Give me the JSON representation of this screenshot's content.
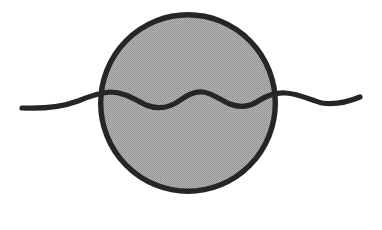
{
  "figure": {
    "title": "Wavy line through shaded circle",
    "background_color": "#ffffff",
    "canvas": {
      "width": 382,
      "height": 230
    }
  },
  "style": {
    "ink_color": "#262626",
    "fill_color": "#a9a9a9",
    "fill_texture": "halftone-dither",
    "halftone_dot_color": "#8c8c8c",
    "stroke_width_circle": 5.4,
    "stroke_width_wave": 5.2,
    "stroke_linecap": "round"
  },
  "shapes": {
    "circle": {
      "name": "shaded-circle",
      "center_x": 188,
      "center_y": 103,
      "radius_x": 90,
      "radius_y": 91,
      "bounds": {
        "left": 98,
        "top": 12,
        "right": 278,
        "bottom": 194
      },
      "fill": "#a9a9a9",
      "stroke": "#262626"
    },
    "wave": {
      "name": "wavy-line",
      "start_x": 22,
      "start_y": 108,
      "end_x": 360,
      "end_y": 97,
      "stroke": "#262626",
      "path": "M 22 108 C 46 109 62 107 78 101 C 90 96 98 93 110 92 C 124 92 134 99 146 105 C 158 110 170 108 182 99 C 190 93 196 91 203 92 C 212 93 220 100 230 104 C 240 108 250 107 260 100 C 268 95 276 92 286 93 C 300 94 310 100 322 103 C 336 105 348 102 360 97",
      "crossings": [
        {
          "label": "left-crossing",
          "x": 100,
          "y": 93
        },
        {
          "label": "right-crossing",
          "x": 277,
          "y": 93
        }
      ],
      "extrema": [
        {
          "label": "left-tail-tip",
          "x": 22,
          "y": 108
        },
        {
          "label": "trough-1",
          "x": 150,
          "y": 107
        },
        {
          "label": "crest-1",
          "x": 201,
          "y": 92
        },
        {
          "label": "trough-2",
          "x": 240,
          "y": 106
        },
        {
          "label": "right-tail-dip",
          "x": 318,
          "y": 103
        },
        {
          "label": "right-tail-tip",
          "x": 360,
          "y": 97
        }
      ]
    }
  }
}
